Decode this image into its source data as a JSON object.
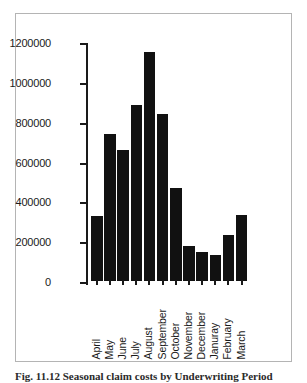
{
  "figure": {
    "caption": "Fig. 11.12  Seasonal claim costs by Underwriting Period",
    "frame_color": "#b4b4b4",
    "bar_color": "#111111",
    "axis_color": "#1a1a1a",
    "background": "#ffffff"
  },
  "chart_data": {
    "type": "bar",
    "title": "",
    "xlabel": "",
    "ylabel": "",
    "categories": [
      "April",
      "May",
      "June",
      "July",
      "August",
      "September",
      "October",
      "November",
      "December",
      "Januray",
      "February",
      "March"
    ],
    "values": [
      324000,
      737000,
      657000,
      884000,
      1152000,
      838000,
      467000,
      176000,
      146000,
      131000,
      231000,
      331000
    ],
    "ylim": [
      0,
      1200000
    ],
    "ytick_values": [
      0,
      200000,
      400000,
      600000,
      800000,
      1000000,
      1200000
    ],
    "ytick_labels": [
      "0",
      "200000",
      "400000",
      "600000",
      "800000",
      "1000000",
      "1200000"
    ],
    "grid": false,
    "legend": null,
    "legend_position": "none",
    "series": [
      {
        "name": "Claim amount",
        "values": [
          324000,
          737000,
          657000,
          884000,
          1152000,
          838000,
          467000,
          176000,
          146000,
          131000,
          231000,
          331000
        ]
      }
    ]
  }
}
